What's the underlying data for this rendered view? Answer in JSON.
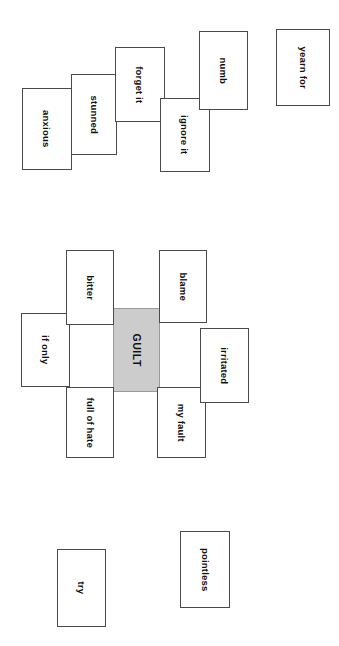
{
  "diagram": {
    "background_color": "#ffffff",
    "card_border_color": "#4a4a4a",
    "card_fill_color": "#ffffff",
    "center_fill_color": "#cccccc",
    "text_color": "#111111",
    "text_orientation": "rotated-90-clockwise",
    "groups": {
      "top_row_label": "top cluster",
      "center_cluster_label": "guilt cluster",
      "bottom_row_label": "bottom cluster"
    },
    "cards": [
      {
        "id": "anxious",
        "label": "anxious",
        "group": "top",
        "x": 22,
        "y": 88,
        "w": 50,
        "h": 82,
        "fill": "#ffffff"
      },
      {
        "id": "stunned",
        "label": "stunned",
        "group": "top",
        "x": 71,
        "y": 74,
        "w": 46,
        "h": 81,
        "fill": "#ffffff"
      },
      {
        "id": "forget-it",
        "label": "forget it",
        "group": "top",
        "x": 115,
        "y": 47,
        "w": 50,
        "h": 75,
        "fill": "#ffffff"
      },
      {
        "id": "ignore-it",
        "label": "ignore it",
        "group": "top",
        "x": 160,
        "y": 98,
        "w": 50,
        "h": 74,
        "fill": "#ffffff"
      },
      {
        "id": "numb",
        "label": "numb",
        "group": "top",
        "x": 199,
        "y": 31,
        "w": 49,
        "h": 79,
        "fill": "#ffffff"
      },
      {
        "id": "yearn-for",
        "label": "yearn for",
        "group": "top",
        "x": 276,
        "y": 29,
        "w": 54,
        "h": 77,
        "fill": "#ffffff"
      },
      {
        "id": "if-only",
        "label": "if only",
        "group": "center",
        "x": 21,
        "y": 313,
        "w": 49,
        "h": 74,
        "fill": "#ffffff"
      },
      {
        "id": "bitter",
        "label": "bitter",
        "group": "center",
        "x": 66,
        "y": 250,
        "w": 48,
        "h": 75,
        "fill": "#ffffff"
      },
      {
        "id": "full-of-hate",
        "label": "full of hate",
        "group": "center",
        "x": 66,
        "y": 387,
        "w": 48,
        "h": 71,
        "fill": "#ffffff"
      },
      {
        "id": "guilt",
        "label": "GUILT",
        "group": "center",
        "x": 113,
        "y": 308,
        "w": 47,
        "h": 84,
        "fill": "#cccccc",
        "center": true
      },
      {
        "id": "blame",
        "label": "blame",
        "group": "center",
        "x": 159,
        "y": 250,
        "w": 48,
        "h": 73,
        "fill": "#ffffff"
      },
      {
        "id": "my-fault",
        "label": "my fault",
        "group": "center",
        "x": 157,
        "y": 387,
        "w": 49,
        "h": 71,
        "fill": "#ffffff"
      },
      {
        "id": "irritated",
        "label": "irritated",
        "group": "center",
        "x": 200,
        "y": 328,
        "w": 49,
        "h": 75,
        "fill": "#ffffff"
      },
      {
        "id": "try",
        "label": "try",
        "group": "bottom",
        "x": 57,
        "y": 549,
        "w": 49,
        "h": 78,
        "fill": "#ffffff"
      },
      {
        "id": "pointless",
        "label": "pointless",
        "group": "bottom",
        "x": 180,
        "y": 531,
        "w": 50,
        "h": 77,
        "fill": "#ffffff"
      }
    ]
  }
}
